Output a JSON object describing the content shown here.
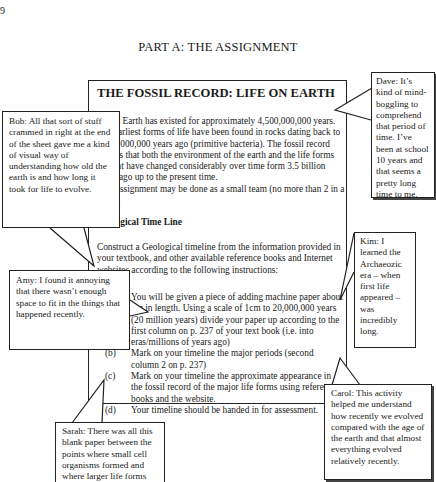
{
  "page": {
    "page_number": "9",
    "heading": "PART A: THE ASSIGNMENT"
  },
  "assignment": {
    "title": "THE FOSSIL RECORD: LIFE ON EARTH",
    "intro": "Planet Earth has existed for approximately 4,500,000,000 years. The earliest forms of life have been found in rocks dating back to 3,500,000,000 years ago (primitive bacteria). The fossil record tells us that both the environment of the earth and the life forms present have changed considerably over time form 3.5 billion years ago up to the present time.",
    "team_note": "This assignment may be done as a small team (no more than 2 in a team).",
    "section_heading": "Geological Time Line",
    "section_intro": "Construct a Geological timeline from the information provided in your textbook, and other available reference books and Internet websites according to the following instructions:",
    "instructions": [
      {
        "label": "(a)",
        "text": "You will be given a piece of adding machine paper about 2m in length. Using a scale of 1cm to 20,000,000 years (20 million years) divide your paper up according to the first column on p. 237 of your text book (i.e. into eras/millions of years ago)"
      },
      {
        "label": "(b)",
        "text": "Mark on your timeline the major periods (second column 2 on p. 237)"
      },
      {
        "label": "(c)",
        "text": "Mark on your timeline the approximate appearance in the fossil record of the major life forms using reference books and the website."
      },
      {
        "label": "(d)",
        "text": "Your timeline should be handed in for assessment."
      }
    ]
  },
  "callouts": {
    "dave": "Dave: It’s kind of mind-boggling to comprehend that period of time. I’ve been at school 10 years and that seems a pretty long time to me.",
    "bob": "Bob: All that sort of stuff crammed in right at the end of the sheet gave me a kind of visual way of understanding how old the earth is and how long it took for life to evolve.",
    "kim": "Kim: I learned the Archaeozic era – when first life appeared – was incredibly long.",
    "amy": "Amy: I found it annoying that there wasn’t enough space to fit in the things that happened recently.",
    "carol": "Carol: This activity helped me understand how recently we evolved compared with the age of the earth and that almost everything evolved relatively recently.",
    "sarah": "Sarah: There was all this blank paper between the points where small cell organisms formed and where larger life forms"
  }
}
